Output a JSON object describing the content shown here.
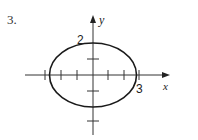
{
  "problem": {
    "number": "3."
  },
  "axes": {
    "x_label": "x",
    "y_label": "y"
  },
  "labels": {
    "y_intercept": "2",
    "x_intercept": "3"
  },
  "ellipse": {
    "equation_semi_axis_x": 3,
    "equation_semi_axis_y": 2,
    "center": [
      0,
      0
    ]
  },
  "colors": {
    "stroke": "#1a1a1a",
    "background": "#ffffff"
  }
}
